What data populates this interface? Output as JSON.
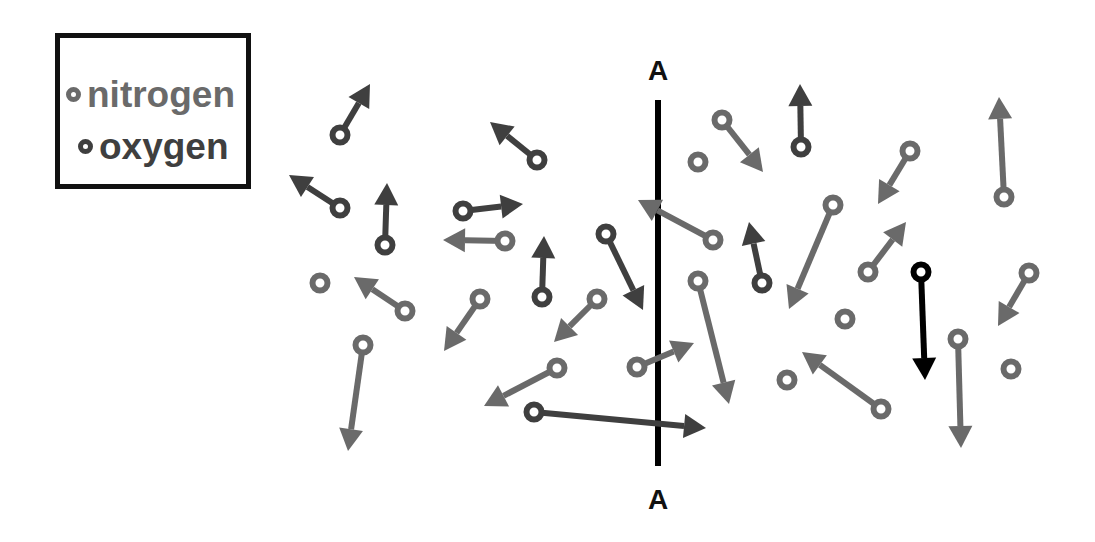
{
  "legend": {
    "items": [
      {
        "label": "nitrogen",
        "color": "#6a6a6a"
      },
      {
        "label": "oxygen",
        "color": "#3f3f3f"
      }
    ]
  },
  "line": {
    "label_top": "A",
    "label_bottom": "A",
    "x": 658,
    "y1": 100,
    "y2": 466,
    "color": "#000000"
  },
  "colors": {
    "nitrogen": "#6a6a6a",
    "oxygen": "#3f3f3f",
    "highlight": "#000000"
  },
  "molecules": [
    {
      "type": "oxygen",
      "x": 340,
      "y": 135,
      "tx": 370,
      "ty": 84
    },
    {
      "type": "oxygen",
      "x": 340,
      "y": 208,
      "tx": 289,
      "ty": 175
    },
    {
      "type": "oxygen",
      "x": 385,
      "y": 245,
      "tx": 387,
      "ty": 183
    },
    {
      "type": "oxygen",
      "x": 463,
      "y": 211,
      "tx": 523,
      "ty": 204
    },
    {
      "type": "nitrogen",
      "x": 505,
      "y": 241,
      "tx": 443,
      "ty": 240
    },
    {
      "type": "oxygen",
      "x": 537,
      "y": 160,
      "tx": 490,
      "ty": 122
    },
    {
      "type": "nitrogen",
      "x": 320,
      "y": 283
    },
    {
      "type": "nitrogen",
      "x": 405,
      "y": 311,
      "tx": 354,
      "ty": 277
    },
    {
      "type": "nitrogen",
      "x": 363,
      "y": 345,
      "tx": 348,
      "ty": 451
    },
    {
      "type": "nitrogen",
      "x": 480,
      "y": 299,
      "tx": 444,
      "ty": 351
    },
    {
      "type": "oxygen",
      "x": 542,
      "y": 297,
      "tx": 544,
      "ty": 236
    },
    {
      "type": "nitrogen",
      "x": 597,
      "y": 299,
      "tx": 554,
      "ty": 342
    },
    {
      "type": "oxygen",
      "x": 606,
      "y": 234,
      "tx": 643,
      "ty": 310
    },
    {
      "type": "nitrogen",
      "x": 557,
      "y": 368,
      "tx": 484,
      "ty": 406
    },
    {
      "type": "oxygen",
      "x": 534,
      "y": 412,
      "tx": 706,
      "ty": 428
    },
    {
      "type": "nitrogen",
      "x": 637,
      "y": 367,
      "tx": 694,
      "ty": 343
    },
    {
      "type": "nitrogen",
      "x": 713,
      "y": 240,
      "tx": 638,
      "ty": 200
    },
    {
      "type": "nitrogen",
      "x": 698,
      "y": 162
    },
    {
      "type": "nitrogen",
      "x": 722,
      "y": 120,
      "tx": 763,
      "ty": 172
    },
    {
      "type": "oxygen",
      "x": 801,
      "y": 147,
      "tx": 800,
      "ty": 84
    },
    {
      "type": "oxygen",
      "x": 762,
      "y": 283,
      "tx": 749,
      "ty": 222
    },
    {
      "type": "nitrogen",
      "x": 698,
      "y": 281,
      "tx": 729,
      "ty": 404
    },
    {
      "type": "nitrogen",
      "x": 833,
      "y": 205,
      "tx": 789,
      "ty": 309
    },
    {
      "type": "nitrogen",
      "x": 910,
      "y": 151,
      "tx": 878,
      "ty": 204
    },
    {
      "type": "nitrogen",
      "x": 868,
      "y": 272,
      "tx": 906,
      "ty": 222
    },
    {
      "type": "nitrogen",
      "x": 845,
      "y": 319
    },
    {
      "type": "nitrogen",
      "x": 787,
      "y": 380
    },
    {
      "type": "nitrogen",
      "x": 881,
      "y": 409,
      "tx": 802,
      "ty": 352
    },
    {
      "type": "highlight",
      "x": 921,
      "y": 272,
      "tx": 925,
      "ty": 380
    },
    {
      "type": "nitrogen",
      "x": 958,
      "y": 339,
      "tx": 961,
      "ty": 448
    },
    {
      "type": "nitrogen",
      "x": 1004,
      "y": 197,
      "tx": 999,
      "ty": 97
    },
    {
      "type": "nitrogen",
      "x": 1029,
      "y": 273,
      "tx": 998,
      "ty": 326
    },
    {
      "type": "nitrogen",
      "x": 1011,
      "y": 369
    }
  ]
}
